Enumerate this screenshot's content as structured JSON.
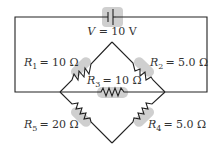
{
  "diagram": {
    "type": "circuit",
    "battery": {
      "label": "V = 10 V",
      "symbol": "V",
      "value": "10 V"
    },
    "resistors": [
      {
        "id": "R1",
        "name": "R",
        "sub": "1",
        "value": "= 10 Ω"
      },
      {
        "id": "R2",
        "name": "R",
        "sub": "2",
        "value": "= 5.0 Ω"
      },
      {
        "id": "R3",
        "name": "R",
        "sub": "3",
        "value": "= 10 Ω"
      },
      {
        "id": "R4",
        "name": "R",
        "sub": "4",
        "value": "= 5.0 Ω"
      },
      {
        "id": "R5",
        "name": "R",
        "sub": "5",
        "value": "= 20 Ω"
      }
    ],
    "colors": {
      "wire": "#222222",
      "highlight": "#c8c8c8",
      "text": "#333333"
    }
  }
}
